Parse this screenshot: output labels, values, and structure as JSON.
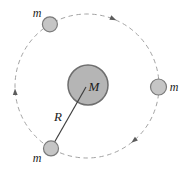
{
  "figure": {
    "type": "orbital-motion-diagram",
    "background_color": "#ffffff"
  },
  "orbit": {
    "direction": "clockwise",
    "path_color": "#a3a3a3",
    "arrow_color": "#5c5c5c"
  },
  "central_mass": {
    "label": "M",
    "fill": "#b5b5b5",
    "stroke": "#6e6e6e"
  },
  "satellites": [
    {
      "label": "m",
      "position": "top-left"
    },
    {
      "label": "m",
      "position": "right"
    },
    {
      "label": "m",
      "position": "bottom-left"
    }
  ],
  "satellite_style": {
    "fill": "#c5c5c5",
    "stroke": "#7a7a7a"
  },
  "radius_line": {
    "label": "R",
    "color": "#404040"
  }
}
